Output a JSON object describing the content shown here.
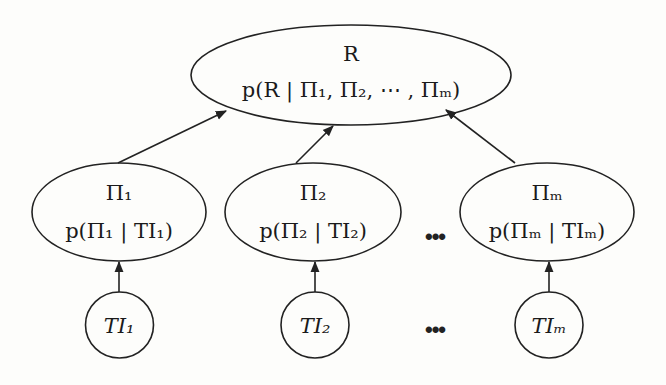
{
  "diagram": {
    "type": "bayesian-network",
    "root": {
      "id": "R",
      "title": "R",
      "formula": "p(R | Π₁, Π₂, ⋯ , Πₘ)"
    },
    "middle_nodes": [
      {
        "id": "Pi1",
        "title": "Π₁",
        "formula": "p(Π₁ | TI₁)"
      },
      {
        "id": "Pi2",
        "title": "Π₂",
        "formula": "p(Π₂ | TI₂)"
      },
      {
        "id": "Pim",
        "title": "Πₘ",
        "formula": "p(Πₘ | TIₘ)"
      }
    ],
    "leaf_nodes": [
      {
        "id": "TI1",
        "title": "TI₁"
      },
      {
        "id": "TI2",
        "title": "TI₂"
      },
      {
        "id": "TIm",
        "title": "TIₘ"
      }
    ],
    "ellipsis": "•••",
    "edges": [
      {
        "from": "TI1",
        "to": "Pi1"
      },
      {
        "from": "TI2",
        "to": "Pi2"
      },
      {
        "from": "TIm",
        "to": "Pim"
      },
      {
        "from": "Pi1",
        "to": "R"
      },
      {
        "from": "Pi2",
        "to": "R"
      },
      {
        "from": "Pim",
        "to": "R"
      }
    ]
  }
}
